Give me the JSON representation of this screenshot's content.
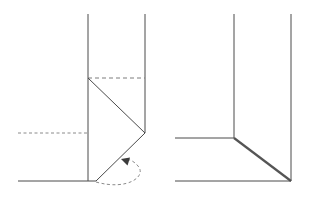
{
  "figure": {
    "background_color": "#ffffff",
    "line_color": "#4a4a4a",
    "dash_color": "#7d7d7d",
    "arrow_color": "#3c3c3c",
    "width": 317,
    "height": 200,
    "panels": [
      {
        "id": "left-panel",
        "name": "fold-in-progress-panel",
        "caption": "",
        "elements": [
          {
            "name": "left-panel-vertical-left-edge",
            "type": "line",
            "style": "solid",
            "points": "88,14 88,181"
          },
          {
            "name": "left-panel-vertical-right-edge",
            "type": "line",
            "style": "solid",
            "points": "145,14 145,133"
          },
          {
            "name": "left-panel-fold-crease-top",
            "type": "line",
            "style": "dashed",
            "points": "88,78 145,78"
          },
          {
            "name": "left-panel-diagonal-upper",
            "type": "line",
            "style": "solid",
            "points": "88,78 145,133"
          },
          {
            "name": "left-panel-diagonal-lower",
            "type": "line",
            "style": "solid",
            "points": "145,133 96,181"
          },
          {
            "name": "left-panel-reference-line-left",
            "type": "line",
            "style": "dashed",
            "points": "18,133 88,133"
          },
          {
            "name": "left-panel-base-horizontal",
            "type": "line",
            "style": "solid",
            "points": "18,181 96,181"
          },
          {
            "name": "left-panel-fold-motion-arrow",
            "type": "curve",
            "style": "dashed",
            "points": "96,182 C 128,190 146,176 138,166 C 133,160 128,159 124,160"
          }
        ]
      },
      {
        "id": "right-panel",
        "name": "completed-fold-panel",
        "caption": "",
        "elements": [
          {
            "name": "right-panel-vertical-left-edge",
            "type": "line",
            "style": "solid",
            "points": "234,14 234,138"
          },
          {
            "name": "right-panel-vertical-right-edge",
            "type": "line",
            "style": "solid",
            "points": "291,14 291,181"
          },
          {
            "name": "right-panel-shoulder-horizontal",
            "type": "line",
            "style": "solid",
            "points": "175,138 234,138"
          },
          {
            "name": "right-panel-folded-edge-diagonal",
            "type": "line",
            "style": "solid-thick",
            "points": "234,138 291,181"
          },
          {
            "name": "right-panel-base-horizontal",
            "type": "line",
            "style": "solid",
            "points": "175,181 291,181"
          }
        ]
      }
    ]
  }
}
